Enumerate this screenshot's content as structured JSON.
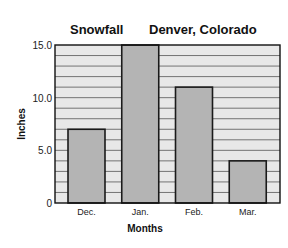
{
  "chart_data": {
    "type": "bar",
    "title": "Snowfall",
    "subtitle": "Denver, Colorado",
    "xlabel": "Months",
    "ylabel": "Inches",
    "categories": [
      "Dec.",
      "Jan.",
      "Feb.",
      "Mar."
    ],
    "values": [
      7,
      15,
      11,
      4
    ],
    "ylim": [
      0,
      15
    ],
    "yticks": [
      0,
      5,
      10,
      15
    ],
    "ytick_labels": [
      "0",
      "5.0",
      "10.0",
      "15.0"
    ],
    "grid": true,
    "grid_step": 1,
    "colors": {
      "bar_fill": "#b4b4b4",
      "bar_stroke": "#1a1a1a",
      "plot_bg": "#e8e8e8",
      "grid": "#555555"
    }
  }
}
